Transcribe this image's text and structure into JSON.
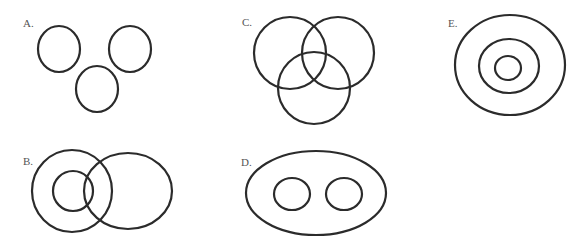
{
  "diagram": {
    "type": "set-relationship-diagrams",
    "stroke_color": "#2b2b2b",
    "label_color": "#555555",
    "panels": [
      {
        "id": "A",
        "label": "A.",
        "label_pos": [
          23,
          27
        ],
        "description": "three disjoint circles",
        "shapes": [
          {
            "cx": 59,
            "cy": 49,
            "rx": 21,
            "ry": 23
          },
          {
            "cx": 130,
            "cy": 49,
            "rx": 21,
            "ry": 23
          },
          {
            "cx": 97,
            "cy": 89,
            "rx": 21,
            "ry": 23
          }
        ]
      },
      {
        "id": "B",
        "label": "B.",
        "label_pos": [
          23,
          165
        ],
        "description": "circle containing smaller circle, overlapping a third ellipse which also overlaps the small circle",
        "shapes": [
          {
            "cx": 72,
            "cy": 191,
            "rx": 40,
            "ry": 41
          },
          {
            "cx": 73,
            "cy": 191,
            "rx": 20,
            "ry": 20
          },
          {
            "cx": 128,
            "cy": 191,
            "rx": 44,
            "ry": 38
          }
        ]
      },
      {
        "id": "C",
        "label": "C.",
        "label_pos": [
          242,
          26
        ],
        "description": "three mutually overlapping circles",
        "shapes": [
          {
            "cx": 290,
            "cy": 53,
            "rx": 36,
            "ry": 36
          },
          {
            "cx": 338,
            "cy": 53,
            "rx": 36,
            "ry": 36
          },
          {
            "cx": 314,
            "cy": 88,
            "rx": 36,
            "ry": 36
          }
        ]
      },
      {
        "id": "D",
        "label": "D.",
        "label_pos": [
          241,
          166
        ],
        "description": "large ellipse containing two disjoint circles",
        "shapes": [
          {
            "cx": 316,
            "cy": 193,
            "rx": 70,
            "ry": 42
          },
          {
            "cx": 292,
            "cy": 194,
            "rx": 18,
            "ry": 16
          },
          {
            "cx": 344,
            "cy": 194,
            "rx": 18,
            "ry": 16
          }
        ]
      },
      {
        "id": "E",
        "label": "E.",
        "label_pos": [
          448,
          27
        ],
        "description": "three concentric circles",
        "shapes": [
          {
            "cx": 510,
            "cy": 65,
            "rx": 55,
            "ry": 50
          },
          {
            "cx": 509,
            "cy": 66,
            "rx": 30,
            "ry": 27
          },
          {
            "cx": 508,
            "cy": 68,
            "rx": 13,
            "ry": 12
          }
        ]
      }
    ]
  }
}
